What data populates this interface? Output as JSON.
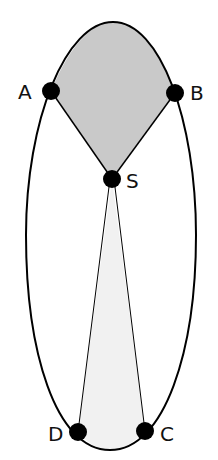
{
  "diagram": {
    "type": "ellipse-with-sectors",
    "colors": {
      "outline": "#000000",
      "upper_region_fill": "#c9c9c9",
      "lower_region_fill": "#f1f1f1",
      "point_fill": "#000000",
      "label": "#111111"
    },
    "points": {
      "A": {
        "label": "A",
        "x": 51,
        "y": 91
      },
      "B": {
        "label": "B",
        "x": 175,
        "y": 93
      },
      "S": {
        "label": "S",
        "x": 112,
        "y": 179
      },
      "D": {
        "label": "D",
        "x": 78,
        "y": 432
      },
      "C": {
        "label": "C",
        "x": 145,
        "y": 431
      }
    }
  }
}
